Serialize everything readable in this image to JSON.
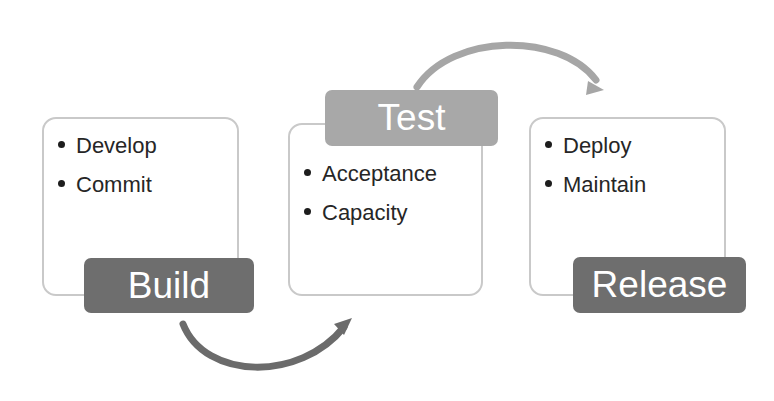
{
  "diagram": {
    "colors": {
      "canvas": "#ffffff",
      "card_border": "#c9c9c9",
      "label_dark": "#6e6e6e",
      "label_light": "#a8a8a8",
      "arrow_dark": "#6b6b6b",
      "arrow_light": "#a6a6a6",
      "bullet_text": "#262626"
    },
    "stages": [
      {
        "key": "build",
        "label": "Build",
        "label_fill": "#6e6e6e",
        "items": [
          "Develop",
          "Commit"
        ]
      },
      {
        "key": "test",
        "label": "Test",
        "label_fill": "#a8a8a8",
        "items": [
          "Acceptance",
          "Capacity"
        ]
      },
      {
        "key": "release",
        "label": "Release",
        "label_fill": "#6e6e6e",
        "items": [
          "Deploy",
          "Maintain"
        ]
      }
    ],
    "connectors": [
      {
        "key": "build-to-test",
        "from": "build",
        "to": "test",
        "direction": "right",
        "style": "curve-below",
        "color": "#6b6b6b"
      },
      {
        "key": "test-to-release",
        "from": "test",
        "to": "release",
        "direction": "right",
        "style": "curve-above",
        "color": "#a6a6a6"
      }
    ]
  }
}
